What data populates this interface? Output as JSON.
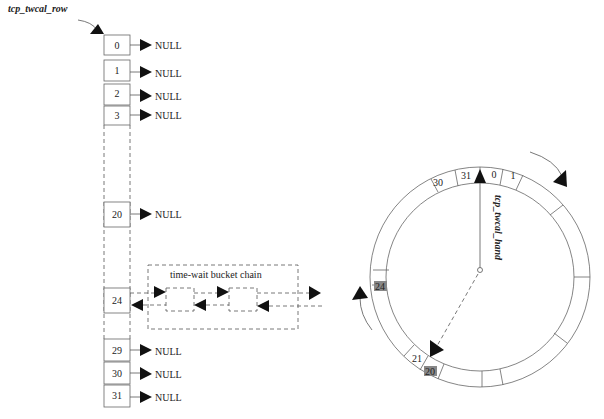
{
  "labels": {
    "row_pointer": "tcp_twcal_row",
    "hand_pointer": "tcp_twcal_hand",
    "chain_title": "time-wait bucket chain",
    "null": "NULL"
  },
  "row_array": {
    "slots": [
      {
        "index": "0",
        "target": "NULL"
      },
      {
        "index": "1",
        "target": "NULL"
      },
      {
        "index": "2",
        "target": "NULL"
      },
      {
        "index": "3",
        "target": "NULL"
      },
      {
        "index": "20",
        "target": "NULL"
      },
      {
        "index": "24",
        "target": "chain"
      },
      {
        "index": "29",
        "target": "NULL"
      },
      {
        "index": "30",
        "target": "NULL"
      },
      {
        "index": "31",
        "target": "NULL"
      }
    ]
  },
  "ring": {
    "slot_labels": [
      "30",
      "31",
      "0",
      "1",
      "24",
      "21",
      "20"
    ],
    "shaded_slots": [
      "24",
      "20"
    ]
  },
  "colors": {
    "line": "#555555",
    "arrow": "#111111",
    "shade": "#888888"
  }
}
